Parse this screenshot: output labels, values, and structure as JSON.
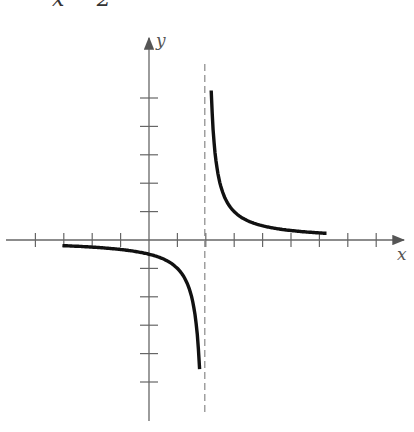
{
  "header": {
    "partial_text": "x − 2"
  },
  "chart_data": {
    "type": "line",
    "xlabel": "x",
    "ylabel": "y",
    "xlim": [
      -5,
      8
    ],
    "ylim": [
      -6,
      6
    ],
    "grid": false,
    "x_ticks": [
      -4,
      -3,
      -2,
      -1,
      1,
      2,
      3,
      4,
      5,
      6,
      7,
      8
    ],
    "y_ticks": [
      -5,
      -4,
      -3,
      -2,
      -1,
      1,
      2,
      3,
      4,
      5
    ],
    "asymptotes": [
      {
        "type": "vertical",
        "x": 2,
        "style": "dashed"
      }
    ],
    "series": [
      {
        "name": "left branch",
        "x": [
          -3,
          -2,
          -1,
          0,
          1,
          1.5,
          1.67,
          1.8
        ],
        "y": [
          -0.2,
          -0.25,
          -0.33,
          -0.5,
          -1,
          -2,
          -3,
          -5
        ]
      },
      {
        "name": "right branch",
        "x": [
          2.2,
          2.33,
          2.5,
          3,
          4,
          5,
          6
        ],
        "y": [
          5,
          3,
          2,
          1,
          0.5,
          0.33,
          0.25
        ]
      }
    ],
    "colors": {
      "curve": "#111111",
      "axes": "#666666",
      "asymptote": "#888888"
    }
  },
  "axis_labels": {
    "x": "x",
    "y": "y"
  }
}
